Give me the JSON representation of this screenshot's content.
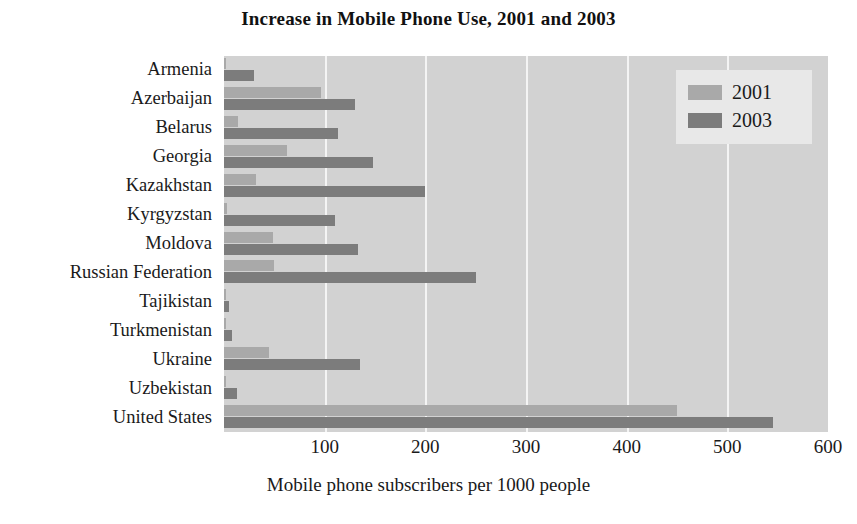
{
  "chart_data": {
    "type": "bar",
    "orientation": "horizontal",
    "title": "Increase in Mobile Phone Use, 2001 and 2003",
    "xlabel": "Mobile phone subscribers per 1000 people",
    "ylabel": "",
    "xlim": [
      0,
      600
    ],
    "xticks": [
      100,
      200,
      300,
      400,
      500,
      600
    ],
    "xtick_labels": [
      "100",
      "200",
      "300",
      "400",
      "500",
      "600"
    ],
    "grid": true,
    "grid_axis": "x",
    "legend_position": "top-right",
    "categories": [
      "Armenia",
      "Azerbaijan",
      "Belarus",
      "Georgia",
      "Kazakhstan",
      "Kyrgyzstan",
      "Moldova",
      "Russian Federation",
      "Tajikistan",
      "Turkmenistan",
      "Ukraine",
      "Uzbekistan",
      "United States"
    ],
    "series": [
      {
        "name": "2001",
        "color": "#a9a9a9",
        "values": [
          2,
          96,
          14,
          63,
          32,
          3,
          49,
          50,
          1,
          1,
          45,
          1,
          450
        ]
      },
      {
        "name": "2003",
        "color": "#7c7c7c",
        "values": [
          30,
          130,
          113,
          148,
          200,
          110,
          133,
          250,
          5,
          8,
          135,
          13,
          545
        ]
      }
    ]
  },
  "legend": {
    "items": [
      {
        "label": "2001",
        "color": "#a9a9a9"
      },
      {
        "label": "2003",
        "color": "#7c7c7c"
      }
    ]
  },
  "colors": {
    "plot_background": "#d2d2d2",
    "gridline": "#f4f4f4",
    "legend_background": "#e8e8e8",
    "page_background": "#ffffff",
    "text": "#1a1a1a"
  }
}
